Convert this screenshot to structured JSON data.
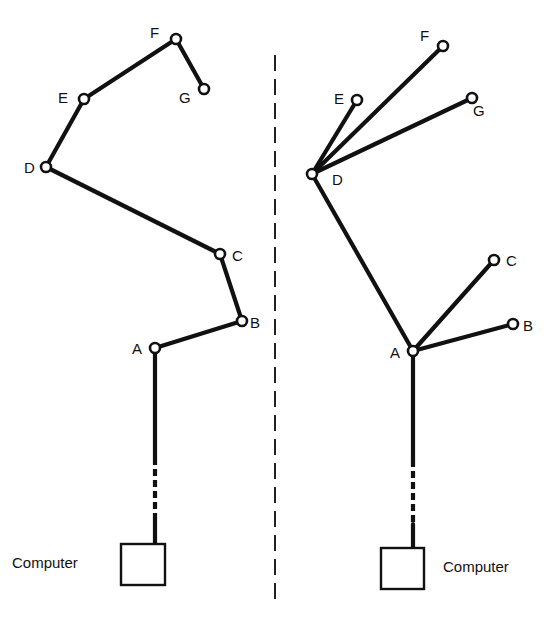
{
  "diagram": {
    "divider": {
      "x": 275,
      "y1": 55,
      "y2": 605
    },
    "left": {
      "title": "Chain (ring) topology",
      "computer_label": "Computer",
      "computer_box": {
        "x": 121,
        "y": 544,
        "w": 44,
        "h": 41
      },
      "trunk": {
        "x": 155,
        "y_top": 348,
        "y_dash_start": 458,
        "y_dash_end": 520,
        "y_bottom": 544
      },
      "nodes": [
        {
          "id": "A",
          "label": "A",
          "x": 155,
          "y": 348,
          "lx": 132,
          "ly": 354
        },
        {
          "id": "B",
          "label": "B",
          "x": 242,
          "y": 321,
          "lx": 250,
          "ly": 328
        },
        {
          "id": "C",
          "label": "C",
          "x": 220,
          "y": 254,
          "lx": 232,
          "ly": 261
        },
        {
          "id": "D",
          "label": "D",
          "x": 46,
          "y": 167,
          "lx": 24,
          "ly": 173
        },
        {
          "id": "E",
          "label": "E",
          "x": 84,
          "y": 99,
          "lx": 58,
          "ly": 103
        },
        {
          "id": "F",
          "label": "F",
          "x": 176,
          "y": 39,
          "lx": 150,
          "ly": 38
        },
        {
          "id": "G",
          "label": "G",
          "x": 204,
          "y": 89,
          "lx": 179,
          "ly": 103
        }
      ],
      "edges": [
        [
          "A",
          "B"
        ],
        [
          "B",
          "C"
        ],
        [
          "C",
          "D"
        ],
        [
          "D",
          "E"
        ],
        [
          "E",
          "F"
        ],
        [
          "F",
          "G"
        ]
      ]
    },
    "right": {
      "title": "Star (tree) topology",
      "computer_label": "Computer",
      "computer_box": {
        "x": 381,
        "y": 548,
        "w": 43,
        "h": 41
      },
      "trunk": {
        "x": 413,
        "y_top": 351,
        "y_dash_start": 460,
        "y_dash_end": 524,
        "y_bottom": 548
      },
      "nodes": [
        {
          "id": "A",
          "label": "A",
          "x": 413,
          "y": 351,
          "lx": 390,
          "ly": 358
        },
        {
          "id": "B",
          "label": "B",
          "x": 513,
          "y": 324,
          "lx": 523,
          "ly": 331
        },
        {
          "id": "C",
          "label": "C",
          "x": 494,
          "y": 260,
          "lx": 506,
          "ly": 266
        },
        {
          "id": "D",
          "label": "D",
          "x": 312,
          "y": 174,
          "lx": 332,
          "ly": 185
        },
        {
          "id": "E",
          "label": "E",
          "x": 357,
          "y": 100,
          "lx": 334,
          "ly": 104
        },
        {
          "id": "F",
          "label": "F",
          "x": 443,
          "y": 46,
          "lx": 420,
          "ly": 41
        },
        {
          "id": "G",
          "label": "G",
          "x": 472,
          "y": 98,
          "lx": 473,
          "ly": 116
        }
      ],
      "edges": [
        [
          "A",
          "B"
        ],
        [
          "A",
          "C"
        ],
        [
          "A",
          "D"
        ],
        [
          "D",
          "E"
        ],
        [
          "D",
          "F"
        ],
        [
          "D",
          "G"
        ]
      ]
    }
  }
}
